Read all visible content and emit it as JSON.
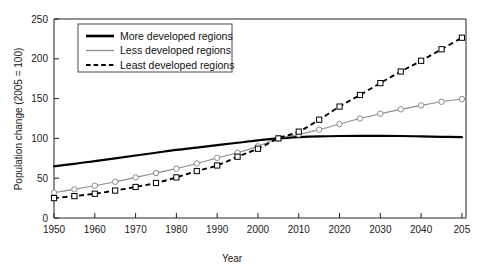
{
  "chart_data": {
    "type": "line",
    "title": "",
    "xlabel": "Year",
    "ylabel": "Population change (2005 = 100)",
    "xlim": [
      1950,
      2051
    ],
    "ylim": [
      0,
      250
    ],
    "xticks": [
      1950,
      1960,
      1970,
      1980,
      1990,
      2000,
      2010,
      2020,
      2030,
      2040,
      2050
    ],
    "xtick_labels": [
      "1950",
      "1960",
      "1970",
      "1980",
      "1990",
      "2000",
      "2010",
      "2020",
      "2030",
      "2040",
      "205"
    ],
    "yticks": [
      0,
      50,
      100,
      150,
      200,
      250
    ],
    "ytick_labels": [
      "0",
      "50",
      "100",
      "150",
      "200",
      "250"
    ],
    "grid": false,
    "legend_position": "upper-left",
    "x": [
      1950,
      1955,
      1960,
      1965,
      1970,
      1975,
      1980,
      1985,
      1990,
      1995,
      2000,
      2005,
      2010,
      2015,
      2020,
      2025,
      2030,
      2035,
      2040,
      2045,
      2050
    ],
    "series": [
      {
        "name": "More developed regions",
        "color": "#000000",
        "style": "solid",
        "marker": "none",
        "values": [
          65,
          68,
          71.5,
          75,
          78.5,
          82,
          85.5,
          88.5,
          91.5,
          94.5,
          97.5,
          100,
          101.5,
          102.5,
          103,
          103.2,
          103.2,
          103,
          102.5,
          102,
          101.5
        ]
      },
      {
        "name": "Less developed regions",
        "color": "#8c8c8c",
        "style": "solid",
        "marker": "circle",
        "values": [
          32,
          36,
          40.5,
          45.5,
          51,
          56.5,
          62,
          68.5,
          75.5,
          82,
          90,
          100,
          105,
          111,
          118,
          125,
          131,
          136.5,
          141.5,
          146,
          149.5
        ]
      },
      {
        "name": "Least developed regions",
        "color": "#000000",
        "style": "dashed",
        "marker": "square",
        "values": [
          25,
          27.5,
          30.5,
          34.5,
          39,
          44,
          51,
          59,
          66,
          77,
          87,
          100,
          108.5,
          123.5,
          140,
          154.5,
          169.5,
          184,
          197.5,
          212,
          226.5
        ]
      }
    ]
  },
  "legend": {
    "items": [
      {
        "label": "More developed regions"
      },
      {
        "label": "Less developed regions"
      },
      {
        "label": "Least developed regions"
      }
    ]
  }
}
